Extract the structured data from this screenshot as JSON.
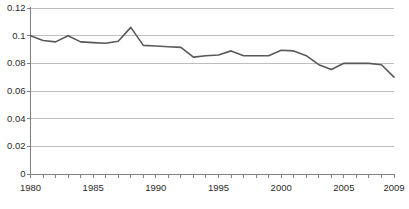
{
  "chart_data": {
    "type": "line",
    "title": "",
    "subtitle": "",
    "xlabel": "",
    "ylabel": "",
    "x": [
      1980,
      1981,
      1982,
      1983,
      1984,
      1985,
      1986,
      1987,
      1988,
      1989,
      1990,
      1991,
      1992,
      1993,
      1994,
      1995,
      1996,
      1997,
      1998,
      1999,
      2000,
      2001,
      2002,
      2003,
      2004,
      2005,
      2006,
      2007,
      2008,
      2009
    ],
    "values": [
      0.1,
      0.0965,
      0.0955,
      0.1,
      0.0955,
      0.095,
      0.0945,
      0.096,
      0.106,
      0.093,
      0.0925,
      0.092,
      0.0915,
      0.0845,
      0.0855,
      0.086,
      0.089,
      0.0855,
      0.0855,
      0.0855,
      0.0895,
      0.089,
      0.0855,
      0.079,
      0.0755,
      0.08,
      0.08,
      0.08,
      0.079,
      0.07
    ],
    "series": [
      {
        "name": "series-1",
        "color": "#595959",
        "values": [
          0.1,
          0.0965,
          0.0955,
          0.1,
          0.0955,
          0.095,
          0.0945,
          0.096,
          0.106,
          0.093,
          0.0925,
          0.092,
          0.0915,
          0.0845,
          0.0855,
          0.086,
          0.089,
          0.0855,
          0.0855,
          0.0855,
          0.0895,
          0.089,
          0.0855,
          0.079,
          0.0755,
          0.08,
          0.08,
          0.08,
          0.079,
          0.07
        ]
      }
    ],
    "xlim": [
      1980,
      2009
    ],
    "ylim": [
      0,
      0.12
    ],
    "y_ticks": [
      0,
      0.02,
      0.04,
      0.06,
      0.08,
      0.1,
      0.12
    ],
    "y_tick_labels": [
      "0",
      "0.02",
      "0.04",
      "0.06",
      "0.08",
      "0.1",
      "0.12"
    ],
    "x_ticks": [
      1980,
      1981,
      1982,
      1983,
      1984,
      1985,
      1986,
      1987,
      1988,
      1989,
      1990,
      1991,
      1992,
      1993,
      1994,
      1995,
      1996,
      1997,
      1998,
      1999,
      2000,
      2001,
      2002,
      2003,
      2004,
      2005,
      2006,
      2007,
      2008,
      2009
    ],
    "x_labeled_ticks": [
      1980,
      1985,
      1990,
      1995,
      2000,
      2005,
      2009
    ],
    "x_tick_labels": [
      "1980",
      "1985",
      "1990",
      "1995",
      "2000",
      "2005",
      "2009"
    ],
    "grid": {
      "horizontal": true,
      "vertical": false,
      "color": "#bfbfbf"
    },
    "legend": {
      "visible": false,
      "position": "none",
      "entries": []
    },
    "axis_color": "#808080",
    "background_color": "#ffffff",
    "annotations": []
  }
}
